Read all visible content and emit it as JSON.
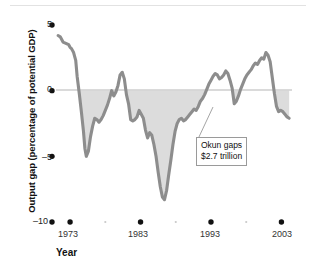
{
  "figure": {
    "background_color": "#ffffff",
    "line_color": "#8d8d8d",
    "band_color": "#dcdcdc",
    "axis_tick_color": "#111111",
    "zero_line_color": "#b5b5b5"
  },
  "annotation": {
    "line1": "Okun gaps",
    "line2": "$2.7 trillion",
    "leader_from_x": 196,
    "leader_from_y": 138,
    "leader_to_x": 212,
    "leader_to_y": 108
  },
  "chart_data": {
    "type": "line",
    "title": "",
    "subtitle": "",
    "xlabel": "Year",
    "ylabel": "Output gap (percentage of potential GDP)",
    "xlim": [
      1971.0,
      2004.5
    ],
    "ylim": [
      -10,
      5
    ],
    "yticks": [
      5,
      0,
      -5,
      -10
    ],
    "ytick_labels": [
      "5",
      "0",
      "–5",
      "–10"
    ],
    "xticks": [
      1973,
      1983,
      1993,
      2003
    ],
    "xtick_labels": [
      "1973",
      "1983",
      "1993",
      "2003"
    ],
    "xticks_minor": [
      1978,
      1988,
      1998
    ],
    "grid": false,
    "legend": null,
    "zero_reference_line": 0,
    "shaded_region": {
      "label": "Okun gaps",
      "description": "Area between zero line and output gap curve where output gap is negative",
      "color": "#dcdcdc",
      "value": "$2.7 trillion"
    },
    "series": [
      {
        "name": "Output gap",
        "color": "#8d8d8d",
        "x": [
          1971.3,
          1971.6,
          1972.0,
          1972.4,
          1972.8,
          1973.0,
          1973.2,
          1973.5,
          1973.8,
          1974.0,
          1974.3,
          1974.6,
          1974.9,
          1975.1,
          1975.3,
          1975.6,
          1975.9,
          1976.2,
          1976.5,
          1976.8,
          1977.1,
          1977.4,
          1977.7,
          1978.0,
          1978.3,
          1978.6,
          1978.9,
          1979.2,
          1979.5,
          1979.8,
          1980.1,
          1980.4,
          1980.7,
          1981.0,
          1981.3,
          1981.6,
          1981.9,
          1982.2,
          1982.5,
          1982.8,
          1983.1,
          1983.4,
          1983.7,
          1984.0,
          1984.3,
          1984.6,
          1984.9,
          1985.2,
          1985.5,
          1985.8,
          1986.1,
          1986.4,
          1986.7,
          1987.0,
          1987.3,
          1987.6,
          1987.9,
          1988.2,
          1988.5,
          1988.8,
          1989.1,
          1989.4,
          1989.7,
          1990.0,
          1990.3,
          1990.6,
          1990.9,
          1991.2,
          1991.5,
          1991.8,
          1992.1,
          1992.4,
          1992.7,
          1993.0,
          1993.3,
          1993.6,
          1993.9,
          1994.2,
          1994.5,
          1994.8,
          1995.1,
          1995.4,
          1995.7,
          1996.0,
          1996.3,
          1996.6,
          1996.9,
          1997.2,
          1997.5,
          1997.8,
          1998.1,
          1998.4,
          1998.7,
          1999.0,
          1999.3,
          1999.6,
          1999.9,
          2000.2,
          2000.5,
          2000.8,
          2001.1,
          2001.4,
          2001.7,
          2002.0,
          2002.3,
          2002.6,
          2002.9,
          2003.2,
          2003.5,
          2003.8
        ],
        "y": [
          4.2,
          4.1,
          3.7,
          3.6,
          3.5,
          3.3,
          3.2,
          2.9,
          2.3,
          1.1,
          -0.2,
          -1.6,
          -3.1,
          -4.4,
          -5.0,
          -4.6,
          -3.5,
          -2.7,
          -2.1,
          -2.2,
          -2.4,
          -2.2,
          -1.9,
          -1.5,
          -1.1,
          -0.6,
          0.0,
          -0.4,
          -0.1,
          0.4,
          1.2,
          1.4,
          0.9,
          -0.3,
          -1.0,
          -2.2,
          -2.3,
          -2.2,
          -2.0,
          -1.5,
          -1.8,
          -2.1,
          -3.0,
          -3.6,
          -3.2,
          -3.4,
          -4.1,
          -5.0,
          -6.2,
          -7.3,
          -8.1,
          -8.3,
          -7.6,
          -6.4,
          -5.3,
          -4.1,
          -3.1,
          -2.5,
          -2.2,
          -2.1,
          -2.3,
          -2.2,
          -2.0,
          -1.8,
          -1.6,
          -1.4,
          -1.5,
          -1.2,
          -0.8,
          -0.6,
          -0.3,
          0.1,
          0.5,
          0.8,
          1.1,
          1.3,
          1.2,
          0.9,
          1.0,
          1.2,
          1.5,
          1.3,
          0.8,
          0.2,
          -0.6,
          -1.1,
          -1.0,
          -1.3,
          -1.8,
          -2.4,
          -2.9,
          -3.2,
          -3.0,
          -2.9,
          -3.1,
          -2.8,
          -2.4,
          -2.1,
          -2.2,
          -2.0,
          -1.7,
          -1.5,
          -1.6,
          -1.4,
          -1.2,
          -1.0,
          -0.8,
          -0.5,
          -0.3,
          0.1
        ]
      }
    ],
    "series_continued_note": "",
    "series_extended": [
      {
        "name": "Output gap (1996-2004 segment)",
        "x": [
          1996.3,
          1996.6,
          1996.9,
          1997.2,
          1997.5,
          1997.8,
          1998.1,
          1998.4,
          1998.7,
          1999.0,
          1999.3,
          1999.6,
          1999.9,
          2000.2,
          2000.5,
          2000.8,
          2001.1,
          2001.4,
          2001.7,
          2002.0,
          2002.3,
          2002.6,
          2002.9,
          2003.2,
          2003.5,
          2003.8,
          2004.1
        ],
        "y": [
          -1.0,
          -0.8,
          -0.4,
          0.1,
          0.5,
          0.9,
          1.2,
          1.4,
          1.6,
          1.9,
          2.1,
          2.0,
          2.3,
          2.5,
          2.4,
          2.9,
          2.7,
          2.2,
          1.0,
          -0.2,
          -1.2,
          -1.6,
          -1.5,
          -1.6,
          -1.8,
          -2.0,
          -2.1
        ]
      }
    ]
  }
}
